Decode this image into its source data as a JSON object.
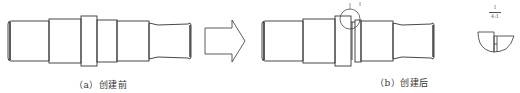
{
  "figure": {
    "panel_a": {
      "caption": "（a）创建前"
    },
    "panel_b": {
      "caption": "（b）创建后",
      "detail_circle_label": "I"
    },
    "detail_view": {
      "label_top": "I",
      "label_bottom": "4:1"
    },
    "arrow": {
      "direction": "right"
    }
  },
  "colors": {
    "stroke": "#333333",
    "background": "#ffffff"
  }
}
